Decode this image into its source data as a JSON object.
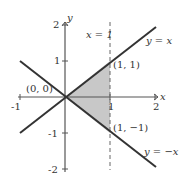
{
  "figure": {
    "type": "region-diagram",
    "axes": {
      "x_label": "x",
      "y_label": "y",
      "x_ticks": [
        "-1",
        "1",
        "2"
      ],
      "y_ticks": [
        "2",
        "1",
        "-1",
        "-2"
      ],
      "x_range": [
        -1,
        2
      ],
      "y_range": [
        -2,
        2
      ]
    },
    "lines": {
      "y_eq_x": "y = x",
      "y_eq_neg_x": "y = −x",
      "x_eq_1": "x = 1"
    },
    "points": {
      "origin": "(0, 0)",
      "p11": "(1, 1)",
      "p1m1": "(1, −1)"
    },
    "shaded_region": "triangle bounded by y = x, y = −x, x = 1",
    "colors": {
      "lines": "#333333",
      "axes": "#555555",
      "shade": "#c8c8c8"
    }
  }
}
